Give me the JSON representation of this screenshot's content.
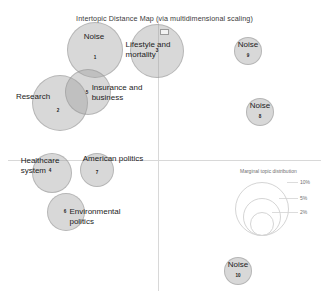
{
  "chart_data": {
    "type": "scatter",
    "title": "Intertopic Distance Map (via multidimensional scaling)",
    "xlabel": "PC1",
    "ylabel": "PC2",
    "grid": false,
    "axes": {
      "x_axis_y": 160,
      "y_axis_x": 158,
      "origin_shown": true
    },
    "legend": {
      "position": "bottom-right",
      "title": "Marginal topic distribution",
      "entries": [
        {
          "label": "2%",
          "value": 2
        },
        {
          "label": "5%",
          "value": 5
        },
        {
          "label": "10%",
          "value": 10
        }
      ]
    },
    "points": [
      {
        "id": 1,
        "label": "Noise",
        "x": 95,
        "y": 50,
        "r": 28,
        "num_x": 95,
        "num_y": 57,
        "lab_x": 94,
        "lab_y": 37
      },
      {
        "id": 2,
        "label": "Research",
        "x": 60,
        "y": 103,
        "r": 28,
        "num_x": 58,
        "num_y": 110,
        "lab_x": 33,
        "lab_y": 97
      },
      {
        "id": 3,
        "label": "Lifestyle and\nmortality",
        "x": 157,
        "y": 51,
        "r": 27,
        "num_x": 157,
        "num_y": 50,
        "lab_x": 148,
        "lab_y": 49
      },
      {
        "id": 4,
        "label": "Healthcare\nsystem",
        "x": 52,
        "y": 173,
        "r": 20,
        "num_x": 50,
        "num_y": 170,
        "lab_x": 40,
        "lab_y": 165
      },
      {
        "id": 5,
        "label": "Insurance and\nbusiness",
        "x": 88,
        "y": 92,
        "r": 23,
        "num_x": 87,
        "num_y": 92,
        "lab_x": 117,
        "lab_y": 92
      },
      {
        "id": 6,
        "label": "Environmental\npolitics",
        "x": 66,
        "y": 212,
        "r": 19,
        "num_x": 65,
        "num_y": 211,
        "lab_x": 95,
        "lab_y": 216
      },
      {
        "id": 7,
        "label": "American politics",
        "x": 97,
        "y": 170,
        "r": 17,
        "num_x": 97,
        "num_y": 172,
        "lab_x": 113,
        "lab_y": 159
      },
      {
        "id": 8,
        "label": "Noise",
        "x": 260,
        "y": 112,
        "r": 14,
        "num_x": 260,
        "num_y": 116,
        "lab_x": 260,
        "lab_y": 106
      },
      {
        "id": 9,
        "label": "Noise",
        "x": 248,
        "y": 51,
        "r": 14,
        "num_x": 248,
        "num_y": 55,
        "lab_x": 248,
        "lab_y": 45
      },
      {
        "id": 10,
        "label": "Noise",
        "x": 238,
        "y": 271,
        "r": 14,
        "num_x": 238,
        "num_y": 275,
        "lab_x": 238,
        "lab_y": 265
      }
    ]
  },
  "colors": {
    "bubble_fill": "#9e9e9e",
    "bubble_stroke": "#8c8c8c",
    "axis": "#d8d8d8",
    "text": "#1c1c1c",
    "legend_text": "#6f6f6f",
    "background": "#ffffff"
  }
}
